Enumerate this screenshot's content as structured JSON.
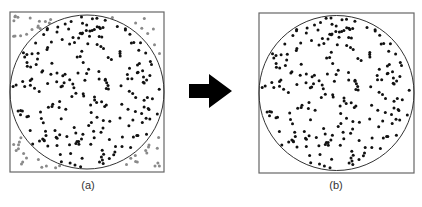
{
  "figure": {
    "panels": [
      {
        "id": "a",
        "caption": "(a)",
        "description": "Random points in a square; points inside the inscribed circle are black, points outside are gray",
        "show_outside_points": true
      },
      {
        "id": "b",
        "caption": "(b)",
        "description": "Only the points inside the inscribed circle are kept",
        "show_outside_points": false
      }
    ],
    "arrow": {
      "direction": "right",
      "icon": "right-arrow-icon"
    },
    "colors": {
      "inside_point": "#111111",
      "outside_point": "#8a8a8a",
      "frame": "#666666",
      "circle": "#333333",
      "arrow": "#000000"
    },
    "seed": 20240517,
    "point_count": 300
  }
}
